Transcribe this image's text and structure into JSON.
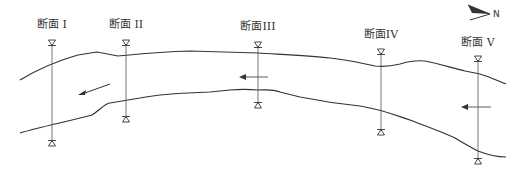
{
  "diagram": {
    "type": "river-plan-cross-sections",
    "north_label": "N",
    "sections": [
      {
        "label": "断面 I",
        "x": 52,
        "label_y": 28,
        "top": 44,
        "bottom": 142
      },
      {
        "label": "断面 II",
        "x": 126,
        "label_y": 28,
        "top": 44,
        "bottom": 118
      },
      {
        "label": "断面III",
        "x": 258,
        "label_y": 30,
        "top": 46,
        "bottom": 104
      },
      {
        "label": "断面IV",
        "x": 381,
        "label_y": 38,
        "top": 53,
        "bottom": 131
      },
      {
        "label": "断面 V",
        "x": 478,
        "label_y": 46,
        "top": 60,
        "bottom": 160
      }
    ],
    "flow_direction": "right-to-left",
    "colors": {
      "line": "#333333",
      "background": "#ffffff"
    }
  }
}
